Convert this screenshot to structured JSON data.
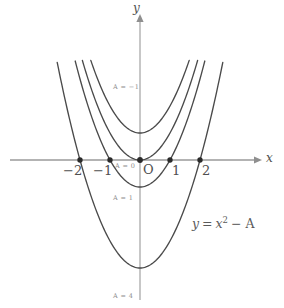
{
  "chart_data": {
    "type": "line",
    "title": "",
    "subtitle": "",
    "equation": "y = x² − A",
    "xlabel": "x",
    "ylabel": "y",
    "xlim": [
      -2.55,
      2.45
    ],
    "ylim": [
      -4.6,
      5.4
    ],
    "grid": false,
    "legend_position": "inline-curve-labels",
    "x_ticks": [
      {
        "value": -2,
        "label": "−2"
      },
      {
        "value": -1,
        "label": "−1"
      },
      {
        "value": 0,
        "label": "O"
      },
      {
        "value": 1,
        "label": "1"
      },
      {
        "value": 2,
        "label": "2"
      }
    ],
    "y_ticks": [],
    "marked_points": [
      {
        "x": -2,
        "y": 0
      },
      {
        "x": -1,
        "y": 0
      },
      {
        "x": 0,
        "y": 0
      },
      {
        "x": 1,
        "y": 0
      },
      {
        "x": 2,
        "y": 0
      }
    ],
    "series": [
      {
        "name": "A = −1",
        "A": -1,
        "label": "A = −1",
        "vertex": [
          0,
          1
        ],
        "roots": []
      },
      {
        "name": "A = 0",
        "A": 0,
        "label": "A = 0",
        "vertex": [
          0,
          0
        ],
        "roots": [
          0
        ]
      },
      {
        "name": "A = 1",
        "A": 1,
        "label": "A = 1",
        "vertex": [
          0,
          -1
        ],
        "roots": [
          -1,
          1
        ]
      },
      {
        "name": "A = 4",
        "A": 4,
        "label": "A = 4",
        "vertex": [
          0,
          -4
        ],
        "roots": [
          -2,
          2
        ]
      }
    ],
    "annotations": [
      {
        "text": "y = x² − A",
        "x": 1.35,
        "y": -2.2
      }
    ],
    "colors": {
      "curve": "#4a4a4a",
      "axis": "#9a9a9a",
      "point": "#2a2a2a",
      "tick_text": "#4f4f4f",
      "curve_label_text": "#8c8c8c",
      "background": "#ffffff"
    }
  },
  "figure": {
    "axis_label_x": "x",
    "axis_label_y": "y",
    "origin_label": "O",
    "tick_neg2": "−2",
    "tick_neg1": "−1",
    "tick_pos1": "1",
    "tick_pos2": "2",
    "curve_label_a_neg1": "A = −1",
    "curve_label_a_0": "A = 0",
    "curve_label_a_1": "A = 1",
    "curve_label_a_4": "A = 4",
    "equation_y": "y",
    "equation_eq": "=",
    "equation_x": "x",
    "equation_exp": "2",
    "equation_minus_a": "− A"
  }
}
